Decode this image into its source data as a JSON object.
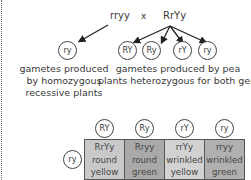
{
  "parents": {
    "left": "rryy",
    "cross_symbol": "x",
    "right": "RrYy"
  },
  "gametes": {
    "homozygous": {
      "circle": "ry",
      "label_lines": [
        "gametes produced",
        "by homozygous",
        "recessive plants"
      ]
    },
    "heterozygous": {
      "circles": [
        "RY",
        "Ry",
        "rY",
        "ry"
      ],
      "label_lines": [
        "gametes produced by pea",
        "plants heterozygous for both genes"
      ]
    }
  },
  "punnett": {
    "column_headers": [
      "RY",
      "Ry",
      "rY",
      "ry"
    ],
    "row_header": "ry",
    "cells": [
      {
        "genotype": "RrYy",
        "shape": "round",
        "color": "yellow",
        "fill": "#c9c9c9"
      },
      {
        "genotype": "Rryy",
        "shape": "round",
        "color": "green",
        "fill": "#a9a9a9"
      },
      {
        "genotype": "rrYy",
        "shape": "wrinkled",
        "color": "yellow",
        "fill": "#d2d2d2"
      },
      {
        "genotype": "rryy",
        "shape": "wrinkled",
        "color": "green",
        "fill": "#b0b0b0"
      }
    ]
  }
}
